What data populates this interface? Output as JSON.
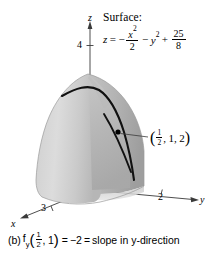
{
  "figure": {
    "surface_heading": "Surface:",
    "equation": {
      "lhs": "z",
      "equals": "=",
      "term1_sign": "−",
      "term1_num": "x",
      "term1_num_exp": "2",
      "term1_den": "2",
      "term2_sign": "−",
      "term2_var": "y",
      "term2_exp": "2",
      "term3_sign": "+",
      "term3_num": "25",
      "term3_den": "8",
      "plain_text": "z = −x²/2 − y² + 25/8"
    },
    "point_label": {
      "open_paren": "(",
      "x_num": "1",
      "x_den": "2",
      "comma1": ",",
      "y": "1",
      "comma2": ",",
      "z": "2",
      "close_paren": ")",
      "plain_text": "(1/2, 1, 2)"
    },
    "axes": {
      "z_name": "z",
      "z_tick": "4",
      "y_name": "y",
      "y_tick": "2",
      "x_name": "x",
      "x_tick": "3"
    },
    "caption": {
      "part_label": "(b)",
      "fn_name": "f",
      "fn_sub": "y",
      "open_paren": "(",
      "arg_x_num": "1",
      "arg_x_den": "2",
      "arg_comma": ",",
      "arg_y": "1",
      "close_paren": ")",
      "equals1": "=",
      "value": "−2",
      "equals2": "=",
      "description": "slope in y-direction",
      "plain_text": "(b) f_y (1/2, 1) = −2 = slope in y-direction"
    },
    "colors": {
      "background": "#ffffff",
      "surface_light": "#d8d8d8",
      "surface_mid": "#bdbdbd",
      "surface_dark": "#a3a3a3",
      "slice_plane": "#b0b0b0",
      "curve": "#000000",
      "axis": "#3a3a3a",
      "text": "#000000"
    }
  }
}
